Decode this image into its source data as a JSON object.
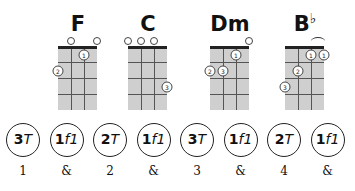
{
  "chords": [
    {
      "name": "F",
      "accidental": "",
      "left": 48,
      "open": [
        1,
        3
      ],
      "dots": [
        {
          "string": 2,
          "fret": 1,
          "finger": "1"
        },
        {
          "string": 0,
          "fret": 2,
          "finger": "2"
        }
      ],
      "barre": null
    },
    {
      "name": "C",
      "accidental": "",
      "left": 118,
      "open": [
        0,
        1,
        2
      ],
      "dots": [
        {
          "string": 3,
          "fret": 3,
          "finger": "3"
        }
      ],
      "barre": null
    },
    {
      "name": "Dm",
      "accidental": "",
      "left": 200,
      "open": [
        3
      ],
      "dots": [
        {
          "string": 2,
          "fret": 1,
          "finger": "1"
        },
        {
          "string": 0,
          "fret": 2,
          "finger": "2"
        },
        {
          "string": 1,
          "fret": 2,
          "finger": "3"
        }
      ],
      "barre": null
    },
    {
      "name": "B",
      "accidental": "♭",
      "left": 275,
      "open": [],
      "dots": [
        {
          "string": 2,
          "fret": 1,
          "finger": "1"
        },
        {
          "string": 3,
          "fret": 1,
          "finger": "1"
        },
        {
          "string": 1,
          "fret": 2,
          "finger": "2"
        },
        {
          "string": 0,
          "fret": 3,
          "finger": "3"
        }
      ],
      "barre": {
        "from": 2,
        "to": 3
      }
    }
  ],
  "pattern": [
    {
      "num": "3",
      "letter": "T",
      "count": "1"
    },
    {
      "num": "1",
      "letter": "f1",
      "count": "&"
    },
    {
      "num": "2",
      "letter": "T",
      "count": "2"
    },
    {
      "num": "1",
      "letter": "f1",
      "count": "&"
    },
    {
      "num": "3",
      "letter": "T",
      "count": "3"
    },
    {
      "num": "1",
      "letter": "f1",
      "count": "&"
    },
    {
      "num": "2",
      "letter": "T",
      "count": "4"
    },
    {
      "num": "1",
      "letter": "f1",
      "count": "&"
    }
  ]
}
